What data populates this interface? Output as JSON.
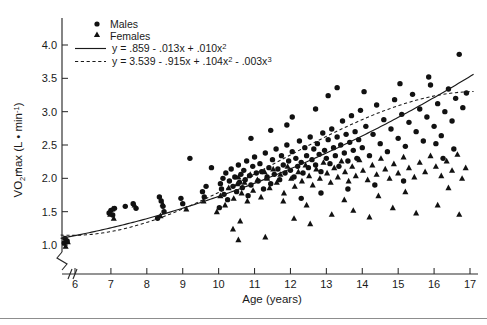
{
  "chart_data": {
    "type": "scatter",
    "title": "",
    "xlabel": "Age (years)",
    "ylabel": "VO2max (L • min-1)",
    "ylabel_parts": {
      "v": "V",
      "o": "O",
      "two": "2",
      "max": "max",
      "open": " (L • min",
      "sup": "-1",
      "close": ")"
    },
    "xlim": [
      5.4,
      17.3
    ],
    "ylim": [
      0.78,
      4.25
    ],
    "xticks": [
      6,
      7,
      8,
      9,
      10,
      11,
      12,
      13,
      14,
      15,
      16,
      17
    ],
    "xticklabels": [
      "6",
      "7",
      "8",
      "9",
      "10",
      "11",
      "12",
      "13",
      "14",
      "15",
      "16",
      "17"
    ],
    "yticks": [
      1.0,
      1.5,
      2.0,
      2.5,
      3.0,
      3.5,
      4.0
    ],
    "yticklabels": [
      "1.0",
      "1.5",
      "2.0",
      "2.5",
      "3.0",
      "3.5",
      "4.0"
    ],
    "grid": false,
    "axis_break": true,
    "legend_position": "top-left",
    "series": [
      {
        "name": "Males",
        "marker": "circle",
        "color": "#111111",
        "points": [
          [
            5.7,
            1.03
          ],
          [
            5.72,
            1.1
          ],
          [
            5.78,
            1.06
          ],
          [
            6.95,
            1.48
          ],
          [
            7.0,
            1.52
          ],
          [
            7.05,
            1.45
          ],
          [
            7.1,
            1.55
          ],
          [
            7.4,
            1.58
          ],
          [
            7.62,
            1.62
          ],
          [
            7.7,
            1.55
          ],
          [
            8.3,
            1.4
          ],
          [
            8.35,
            1.72
          ],
          [
            8.4,
            1.66
          ],
          [
            8.45,
            1.58
          ],
          [
            8.48,
            1.5
          ],
          [
            8.95,
            1.7
          ],
          [
            9.0,
            1.62
          ],
          [
            9.55,
            1.8
          ],
          [
            9.6,
            1.72
          ],
          [
            9.65,
            1.88
          ],
          [
            10.02,
            1.56
          ],
          [
            10.05,
            1.92
          ],
          [
            10.08,
            1.84
          ],
          [
            10.12,
            2.0
          ],
          [
            10.15,
            1.76
          ],
          [
            10.2,
            2.08
          ],
          [
            10.25,
            1.68
          ],
          [
            10.3,
            1.96
          ],
          [
            10.35,
            2.14
          ],
          [
            10.4,
            1.88
          ],
          [
            10.45,
            2.02
          ],
          [
            10.5,
            1.8
          ],
          [
            10.55,
            2.2
          ],
          [
            10.58,
            1.94
          ],
          [
            10.62,
            2.06
          ],
          [
            10.66,
            1.86
          ],
          [
            10.7,
            2.12
          ],
          [
            10.74,
            1.98
          ],
          [
            10.78,
            2.26
          ],
          [
            10.82,
            1.74
          ],
          [
            10.86,
            2.04
          ],
          [
            10.9,
            1.9
          ],
          [
            10.95,
            2.18
          ],
          [
            11.0,
            2.32
          ],
          [
            11.05,
            2.08
          ],
          [
            11.1,
            1.96
          ],
          [
            11.15,
            2.22
          ],
          [
            11.2,
            2.1
          ],
          [
            11.25,
            1.84
          ],
          [
            11.3,
            2.38
          ],
          [
            11.35,
            2.02
          ],
          [
            11.4,
            2.16
          ],
          [
            11.45,
            1.92
          ],
          [
            11.5,
            2.28
          ],
          [
            11.55,
            2.06
          ],
          [
            11.6,
            2.44
          ],
          [
            11.65,
            2.14
          ],
          [
            11.7,
            1.98
          ],
          [
            11.75,
            2.34
          ],
          [
            11.8,
            2.2
          ],
          [
            11.85,
            2.08
          ],
          [
            11.9,
            2.5
          ],
          [
            11.95,
            2.26
          ],
          [
            12.0,
            2.12
          ],
          [
            12.05,
            2.4
          ],
          [
            12.1,
            2.02
          ],
          [
            12.15,
            2.3
          ],
          [
            12.2,
            2.18
          ],
          [
            12.25,
            2.56
          ],
          [
            12.3,
            2.24
          ],
          [
            12.35,
            2.08
          ],
          [
            12.4,
            2.46
          ],
          [
            12.45,
            2.34
          ],
          [
            12.5,
            2.16
          ],
          [
            12.55,
            2.62
          ],
          [
            12.6,
            2.28
          ],
          [
            12.65,
            2.44
          ],
          [
            12.7,
            2.2
          ],
          [
            12.75,
            2.52
          ],
          [
            12.8,
            2.36
          ],
          [
            12.85,
            2.1
          ],
          [
            12.9,
            2.68
          ],
          [
            12.95,
            2.42
          ],
          [
            13.0,
            2.3
          ],
          [
            13.05,
            2.58
          ],
          [
            13.1,
            2.22
          ],
          [
            13.15,
            2.74
          ],
          [
            13.2,
            2.46
          ],
          [
            13.25,
            2.34
          ],
          [
            13.3,
            2.62
          ],
          [
            13.35,
            2.18
          ],
          [
            13.4,
            2.5
          ],
          [
            13.45,
            2.86
          ],
          [
            13.5,
            2.38
          ],
          [
            13.55,
            2.66
          ],
          [
            13.6,
            2.26
          ],
          [
            13.65,
            2.54
          ],
          [
            13.7,
            2.94
          ],
          [
            13.75,
            2.42
          ],
          [
            13.8,
            2.7
          ],
          [
            13.85,
            2.3
          ],
          [
            13.9,
            2.58
          ],
          [
            13.95,
            3.02
          ],
          [
            14.0,
            2.46
          ],
          [
            14.1,
            2.78
          ],
          [
            14.2,
            2.34
          ],
          [
            14.3,
            2.66
          ],
          [
            14.4,
            3.1
          ],
          [
            14.5,
            2.52
          ],
          [
            14.6,
            2.88
          ],
          [
            14.7,
            2.4
          ],
          [
            14.8,
            2.74
          ],
          [
            14.9,
            3.18
          ],
          [
            15.0,
            2.6
          ],
          [
            15.1,
            2.96
          ],
          [
            15.2,
            2.48
          ],
          [
            15.3,
            2.84
          ],
          [
            15.4,
            3.26
          ],
          [
            15.5,
            2.7
          ],
          [
            15.6,
            3.04
          ],
          [
            15.7,
            2.56
          ],
          [
            15.8,
            2.92
          ],
          [
            15.9,
            3.4
          ],
          [
            16.0,
            2.78
          ],
          [
            16.1,
            3.12
          ],
          [
            16.2,
            2.64
          ],
          [
            16.3,
            3.0
          ],
          [
            16.4,
            3.34
          ],
          [
            16.5,
            2.86
          ],
          [
            16.6,
            3.2
          ],
          [
            16.7,
            3.86
          ],
          [
            16.8,
            3.06
          ],
          [
            16.9,
            3.28
          ],
          [
            9.2,
            2.3
          ],
          [
            9.8,
            2.16
          ],
          [
            10.9,
            2.6
          ],
          [
            12.05,
            2.92
          ],
          [
            12.7,
            3.04
          ],
          [
            13.05,
            3.24
          ],
          [
            13.3,
            3.36
          ],
          [
            14.05,
            3.3
          ],
          [
            15.05,
            3.42
          ],
          [
            15.85,
            3.52
          ],
          [
            12.3,
            1.7
          ],
          [
            12.85,
            1.78
          ],
          [
            13.6,
            1.84
          ],
          [
            14.35,
            1.9
          ],
          [
            15.15,
            1.96
          ],
          [
            16.25,
            2.3
          ],
          [
            16.55,
            2.44
          ],
          [
            16.05,
            2.52
          ],
          [
            11.45,
            2.72
          ],
          [
            11.9,
            2.8
          ]
        ]
      },
      {
        "name": "Females",
        "marker": "triangle",
        "color": "#111111",
        "points": [
          [
            5.74,
            0.98
          ],
          [
            5.8,
            1.05
          ],
          [
            6.98,
            1.46
          ],
          [
            7.04,
            1.54
          ],
          [
            7.08,
            1.4
          ],
          [
            7.66,
            1.6
          ],
          [
            8.38,
            1.44
          ],
          [
            8.44,
            1.62
          ],
          [
            9.1,
            1.54
          ],
          [
            9.58,
            1.66
          ],
          [
            10.05,
            1.74
          ],
          [
            10.18,
            1.6
          ],
          [
            10.28,
            1.86
          ],
          [
            10.42,
            1.7
          ],
          [
            10.52,
            1.92
          ],
          [
            10.55,
            2.02
          ],
          [
            10.6,
            1.36
          ],
          [
            10.64,
            1.78
          ],
          [
            10.72,
            1.94
          ],
          [
            10.8,
            1.66
          ],
          [
            10.88,
            2.06
          ],
          [
            10.96,
            1.82
          ],
          [
            11.08,
            1.98
          ],
          [
            11.18,
            1.72
          ],
          [
            11.28,
            2.1
          ],
          [
            11.34,
            2.02
          ],
          [
            11.42,
            1.86
          ],
          [
            11.52,
            2.14
          ],
          [
            11.62,
            1.94
          ],
          [
            11.72,
            2.06
          ],
          [
            11.82,
            1.78
          ],
          [
            11.92,
            2.18
          ],
          [
            12.02,
            2.0
          ],
          [
            12.12,
            1.88
          ],
          [
            12.22,
            2.1
          ],
          [
            12.32,
            1.96
          ],
          [
            12.42,
            2.2
          ],
          [
            12.52,
            2.04
          ],
          [
            12.62,
            1.9
          ],
          [
            12.72,
            2.14
          ],
          [
            12.82,
            2.0
          ],
          [
            12.92,
            2.24
          ],
          [
            13.02,
            2.08
          ],
          [
            13.12,
            1.94
          ],
          [
            13.22,
            2.16
          ],
          [
            13.32,
            2.02
          ],
          [
            13.42,
            2.26
          ],
          [
            13.52,
            2.1
          ],
          [
            13.62,
            1.96
          ],
          [
            13.72,
            2.18
          ],
          [
            13.82,
            2.04
          ],
          [
            13.92,
            2.28
          ],
          [
            14.02,
            2.12
          ],
          [
            14.15,
            1.98
          ],
          [
            14.28,
            2.2
          ],
          [
            14.4,
            2.06
          ],
          [
            14.52,
            2.3
          ],
          [
            14.64,
            2.14
          ],
          [
            14.76,
            2.0
          ],
          [
            14.88,
            2.22
          ],
          [
            15.0,
            2.08
          ],
          [
            15.15,
            2.32
          ],
          [
            15.3,
            2.16
          ],
          [
            15.45,
            2.02
          ],
          [
            15.6,
            2.24
          ],
          [
            15.75,
            2.1
          ],
          [
            15.9,
            2.34
          ],
          [
            16.05,
            2.18
          ],
          [
            16.2,
            2.04
          ],
          [
            16.35,
            2.26
          ],
          [
            16.5,
            2.12
          ],
          [
            16.65,
            2.36
          ],
          [
            16.78,
            2.0
          ],
          [
            16.88,
            2.16
          ],
          [
            10.55,
            1.08
          ],
          [
            11.3,
            1.12
          ],
          [
            12.1,
            1.4
          ],
          [
            12.55,
            1.32
          ],
          [
            13.15,
            1.46
          ],
          [
            13.75,
            1.52
          ],
          [
            14.2,
            1.42
          ],
          [
            14.85,
            1.56
          ],
          [
            15.5,
            1.48
          ],
          [
            16.1,
            1.6
          ],
          [
            16.7,
            1.46
          ],
          [
            11.35,
            2.0
          ],
          [
            11.8,
            1.66
          ],
          [
            12.45,
            1.6
          ],
          [
            13.5,
            1.68
          ],
          [
            14.45,
            1.74
          ],
          [
            15.2,
            1.8
          ],
          [
            16.4,
            1.86
          ],
          [
            10.4,
            1.24
          ],
          [
            9.95,
            1.5
          ]
        ]
      }
    ],
    "fits": [
      {
        "name": "males-fit",
        "equation_plain": "y = .859 - .013x + .010x2",
        "style": "solid",
        "coeffs": [
          0.859,
          -0.013,
          0.01
        ],
        "label_parts": {
          "a": "y = .859 - .013x + .010x",
          "sup1": "2"
        }
      },
      {
        "name": "females-fit",
        "equation_plain": "y = 3.539 - .915x + .104x2 - .003x3",
        "style": "dashed",
        "coeffs": [
          3.539,
          -0.915,
          0.104,
          -0.003
        ],
        "label_parts": {
          "a": "y = 3.539 - .915x + .104x",
          "sup1": "2",
          "b": " - .003x",
          "sup2": "3"
        }
      }
    ]
  },
  "legend": {
    "males_label": "Males",
    "females_label": "Females",
    "eq_males": "y = .859 - .013x + .010x2",
    "eq_females": "y = 3.539 - .915x + .104x2 - .003x3"
  }
}
